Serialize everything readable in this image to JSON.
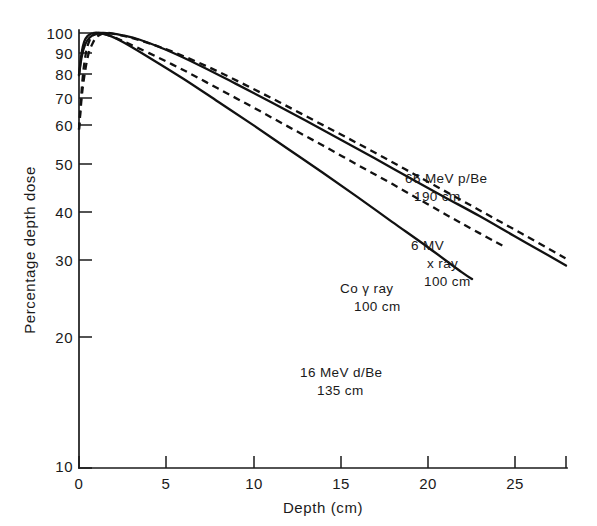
{
  "chart_data": {
    "type": "line",
    "title": "",
    "xlabel": "Depth (cm)",
    "ylabel": "Percentage depth dose",
    "xlim": [
      0,
      28
    ],
    "ylim": [
      10,
      100
    ],
    "yscale": "log",
    "xscale": "linear",
    "grid": false,
    "legend_position": "inline-annotations",
    "xticks": [
      0,
      5,
      10,
      15,
      20,
      25
    ],
    "xtick_labels": [
      "0",
      "5",
      "10",
      "15",
      "20",
      "25"
    ],
    "yticks": [
      10,
      20,
      30,
      40,
      50,
      60,
      70,
      80,
      90,
      100
    ],
    "ytick_labels": [
      "10",
      "20",
      "30",
      "40",
      "50",
      "60",
      "70",
      "80",
      "90",
      "100"
    ],
    "series": [
      {
        "name": "66 MeV p/Be 190 cm",
        "label_line1": "66 MeV p/Be",
        "label_line2": "190 cm",
        "style": "solid",
        "x": [
          0,
          0.15,
          0.35,
          0.6,
          0.9,
          1.3,
          1.8,
          2.5,
          3.5,
          5,
          7,
          9,
          11,
          13,
          15,
          17,
          19,
          21,
          23,
          25,
          27,
          28
        ],
        "y": [
          80,
          88,
          94,
          97.5,
          99.3,
          100,
          99.8,
          98.8,
          96.5,
          91.5,
          84,
          76.5,
          69.5,
          63,
          57,
          51.5,
          46.5,
          42,
          38,
          34.2,
          30.8,
          29.2
        ]
      },
      {
        "name": "6 MV x ray 100 cm",
        "label_line1": "6 MV",
        "label_line2": "x ray",
        "label_line3": "100 cm",
        "style": "dashed",
        "x": [
          0,
          0.2,
          0.5,
          0.8,
          1.1,
          1.5,
          2,
          2.8,
          4,
          5.5,
          7.5,
          9.5,
          11.5,
          13.5,
          15.5,
          17.5,
          19.5,
          21.5,
          23.5,
          25.5,
          27.5,
          28
        ],
        "y": [
          60,
          74,
          88,
          95,
          98.5,
          100,
          99.6,
          98,
          94.8,
          90.2,
          83.3,
          76.2,
          69.4,
          63,
          57.2,
          51.8,
          46.8,
          42.3,
          38.2,
          34.5,
          31.1,
          30.3
        ]
      },
      {
        "name": "Co gamma ray 100 cm",
        "label_line1": "Co γ ray",
        "label_line2": "100 cm",
        "style": "dashed",
        "x": [
          0,
          0.2,
          0.4,
          0.6,
          0.85,
          1.2,
          1.8,
          2.6,
          4,
          6,
          8,
          10,
          12,
          14,
          16,
          18,
          20,
          22,
          24.5
        ],
        "y": [
          60,
          78,
          90,
          96,
          99,
          100,
          98.5,
          95.5,
          90,
          82.2,
          74.5,
          67.5,
          61,
          55.2,
          49.8,
          45,
          40.5,
          36.5,
          32.2
        ]
      },
      {
        "name": "16 MeV d/Be 135 cm",
        "label_line1": "16 MeV d/Be",
        "label_line2": "135 cm",
        "style": "solid",
        "x": [
          0,
          0.15,
          0.3,
          0.5,
          0.8,
          1.2,
          1.8,
          2.6,
          4,
          6,
          8,
          10,
          12,
          14,
          16,
          18,
          20,
          22,
          22.6
        ],
        "y": [
          80,
          90,
          95.5,
          98.5,
          100,
          100,
          98.5,
          95,
          88,
          78.5,
          69.5,
          61.5,
          54.2,
          47.8,
          42,
          36.8,
          32.3,
          28.2,
          27.2
        ]
      }
    ],
    "annotations": [
      {
        "text": "66 MeV p/Be",
        "x": 23.5,
        "y": 46
      },
      {
        "text": "190 cm",
        "x": 23.5,
        "y": 41
      },
      {
        "text": "6 MV",
        "x": 23,
        "y": 33.5
      },
      {
        "text": "x ray",
        "x": 24,
        "y": 31
      },
      {
        "text": "100 cm",
        "x": 24,
        "y": 29
      },
      {
        "text": "Co γ ray",
        "x": 19,
        "y": 26.5
      },
      {
        "text": "100 cm",
        "x": 19.5,
        "y": 24.5
      },
      {
        "text": "16 MeV d/Be",
        "x": 14,
        "y": 19
      },
      {
        "text": "135 cm",
        "x": 14.5,
        "y": 17.5
      }
    ]
  },
  "axes": {
    "x_title": "Depth (cm)",
    "y_title": "Percentage depth dose"
  },
  "labels": {
    "y_100": "100",
    "y_90": "90",
    "y_80": "80",
    "y_70": "70",
    "y_60": "60",
    "y_50": "50",
    "y_40": "40",
    "y_30": "30",
    "y_20": "20",
    "y_10": "10",
    "x_0": "0",
    "x_5": "5",
    "x_10": "10",
    "x_15": "15",
    "x_20": "20",
    "x_25": "25",
    "curve1_l1": "66 MeV p/Be",
    "curve1_l2": "190 cm",
    "curve2_l1": "6 MV",
    "curve2_l2": "x ray",
    "curve2_l3": "100 cm",
    "curve3_l1": "Co γ ray",
    "curve3_l2": "100 cm",
    "curve4_l1": "16 MeV d/Be",
    "curve4_l2": "135 cm"
  }
}
